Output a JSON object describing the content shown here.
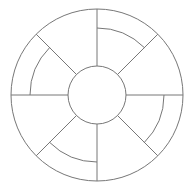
{
  "diagram": {
    "type": "segmented-wheel",
    "segment_count": 8,
    "segment_angles_deg": [
      0,
      45,
      90,
      135,
      180,
      225,
      270,
      315
    ],
    "hub": {
      "label": ""
    },
    "segments": [
      {
        "id": 1,
        "start_deg": 45,
        "end_deg": 90,
        "has_inner_band": true,
        "label": ""
      },
      {
        "id": 2,
        "start_deg": 90,
        "end_deg": 135,
        "has_inner_band": false,
        "label": ""
      },
      {
        "id": 3,
        "start_deg": 135,
        "end_deg": 180,
        "has_inner_band": true,
        "label": ""
      },
      {
        "id": 4,
        "start_deg": 180,
        "end_deg": 225,
        "has_inner_band": false,
        "label": ""
      },
      {
        "id": 5,
        "start_deg": 225,
        "end_deg": 270,
        "has_inner_band": true,
        "label": ""
      },
      {
        "id": 6,
        "start_deg": 270,
        "end_deg": 315,
        "has_inner_band": false,
        "label": ""
      },
      {
        "id": 7,
        "start_deg": 315,
        "end_deg": 360,
        "has_inner_band": true,
        "label": ""
      },
      {
        "id": 8,
        "start_deg": 0,
        "end_deg": 45,
        "has_inner_band": false,
        "label": ""
      }
    ],
    "colors": {
      "line": "#777777",
      "background": "#ffffff"
    }
  }
}
